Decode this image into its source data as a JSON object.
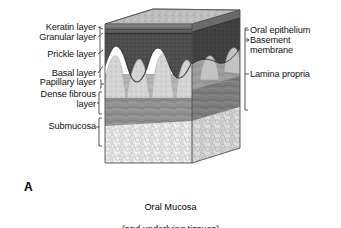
{
  "figure": {
    "panel_letter": "A",
    "caption_line1": "Oral Mucosa",
    "caption_line2": "(and underlying tissues)"
  },
  "left_labels": [
    {
      "id": "keratin-layer",
      "text": "Keratin layer",
      "x": 96,
      "y": 27,
      "align": "right"
    },
    {
      "id": "granular-layer",
      "text": "Granular layer",
      "x": 96,
      "y": 37,
      "align": "right"
    },
    {
      "id": "prickle-layer",
      "text": "Prickle layer",
      "x": 96,
      "y": 54,
      "align": "right"
    },
    {
      "id": "basal-layer",
      "text": "Basal layer",
      "x": 96,
      "y": 73,
      "align": "right"
    },
    {
      "id": "papillary-layer",
      "text": "Papillary layer",
      "x": 96,
      "y": 82,
      "align": "right"
    },
    {
      "id": "dense-fibrous-layer",
      "text": "Dense fibrous\nlayer",
      "x": 96,
      "y": 93,
      "align": "right"
    },
    {
      "id": "submucosa",
      "text": "Submucosa",
      "x": 96,
      "y": 123,
      "align": "right"
    }
  ],
  "right_labels": [
    {
      "id": "oral-epithelium",
      "text": "Oral epithelium",
      "x": 250,
      "y": 27,
      "align": "left"
    },
    {
      "id": "basement-membrane",
      "text": "Basement\nmembrane",
      "x": 250,
      "y": 37,
      "align": "left"
    },
    {
      "id": "lamina-propria",
      "text": "Lamina propria",
      "x": 250,
      "y": 71,
      "align": "left"
    }
  ],
  "layers": [
    {
      "id": "keratin-layer",
      "name": "Keratin layer",
      "order": 1,
      "color": "#8d8d8d"
    },
    {
      "id": "granular-layer",
      "name": "Granular layer",
      "order": 2,
      "color": "#6a6a6a"
    },
    {
      "id": "prickle-layer",
      "name": "Prickle layer",
      "order": 3,
      "color": "#4c4c4c"
    },
    {
      "id": "basal-layer",
      "name": "Basal layer",
      "order": 4,
      "color": "#3a3a3a"
    },
    {
      "id": "papillary-layer",
      "name": "Papillary layer",
      "order": 5,
      "color": "#c9c9c9"
    },
    {
      "id": "dense-fibrous-layer",
      "name": "Dense fibrous layer",
      "order": 6,
      "color": "#9a9a9a"
    },
    {
      "id": "submucosa",
      "name": "Submucosa",
      "order": 7,
      "color": "#e2e2e2"
    }
  ],
  "grouped_regions": [
    {
      "id": "oral-epithelium",
      "name": "Oral epithelium",
      "includes": [
        "Keratin layer",
        "Granular layer",
        "Prickle layer",
        "Basal layer"
      ]
    },
    {
      "id": "basement-membrane",
      "name": "Basement membrane",
      "includes": []
    },
    {
      "id": "lamina-propria",
      "name": "Lamina propria",
      "includes": [
        "Papillary layer",
        "Dense fibrous layer"
      ]
    }
  ],
  "colors": {
    "background": "#ffffff",
    "text": "#111111",
    "leader_line": "#3a3a3a",
    "top_surface": "#b9b9b9",
    "epithelium_dark": "#4a4a4a",
    "papilla_light": "#d6d6d6",
    "lamina_propria": "#b0b0b0",
    "dense_fibrous": "#8f8f8f",
    "submucosa": "#e8e8e8",
    "outline": "#4a4a4a"
  }
}
